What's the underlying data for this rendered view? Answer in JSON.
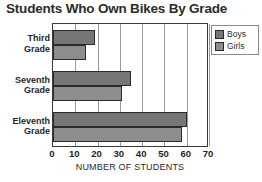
{
  "chart_data": {
    "type": "bar",
    "orientation": "horizontal",
    "title": "Students Who Own Bikes By Grade",
    "xlabel": "NUMBER OF STUDENTS",
    "ylabel": "",
    "categories": [
      "Third Grade",
      "Seventh Grade",
      "Eleventh Grade"
    ],
    "category_lines": [
      [
        "Third",
        "Grade"
      ],
      [
        "Seventh",
        "Grade"
      ],
      [
        "Eleventh",
        "Grade"
      ]
    ],
    "series": [
      {
        "name": "Boys",
        "values": [
          19,
          35,
          60
        ],
        "color": "#767676"
      },
      {
        "name": "Girls",
        "values": [
          15,
          31,
          58
        ],
        "color": "#8d8d8d"
      }
    ],
    "xlim": [
      0,
      70
    ],
    "xticks": [
      0,
      10,
      20,
      30,
      40,
      50,
      60,
      70
    ],
    "xtick_labels": [
      "0",
      "10",
      "20",
      "30",
      "40",
      "50",
      "60",
      "70"
    ],
    "grid": true,
    "grid_axis": "x",
    "legend_position": "top-right"
  },
  "legend": {
    "items": [
      {
        "label": "Boys",
        "swatch": "legend-swatch-boys"
      },
      {
        "label": "Girls",
        "swatch": "legend-swatch-girls"
      }
    ]
  },
  "colors": {
    "boys": "#767676",
    "girls": "#8d8d8d",
    "axis": "#3a3a3a",
    "grid": "#9a9a9a",
    "text": "#1f1f1f",
    "background": "#ffffff"
  }
}
